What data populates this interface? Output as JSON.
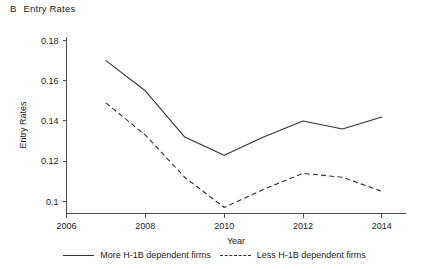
{
  "panel": {
    "letter": "B",
    "title": "Entry Rates"
  },
  "chart_data": {
    "type": "line",
    "title": "Entry Rates",
    "xlabel": "Year",
    "ylabel": "Entry Rates",
    "x": [
      2007,
      2008,
      2009,
      2010,
      2011,
      2012,
      2013,
      2014
    ],
    "xlim": [
      2006,
      2014.6
    ],
    "ylim": [
      0.094,
      0.182
    ],
    "xticks": [
      2006,
      2008,
      2010,
      2012,
      2014
    ],
    "xtick_labels": [
      "2006",
      "2008",
      "2010",
      "2012",
      "2014"
    ],
    "yticks": [
      0.1,
      0.12,
      0.14,
      0.16,
      0.18
    ],
    "ytick_labels": [
      "0.1",
      "0.12",
      "0.14",
      "0.16",
      "0.18"
    ],
    "grid": false,
    "legend_position": "bottom",
    "series": [
      {
        "name": "More H-1B dependent firms",
        "style": "solid",
        "color": "#333333",
        "values": [
          0.17,
          0.155,
          0.132,
          0.123,
          0.132,
          0.14,
          0.136,
          0.142
        ]
      },
      {
        "name": "Less H-1B dependent firms",
        "style": "dashed",
        "color": "#333333",
        "values": [
          0.149,
          0.133,
          0.112,
          0.097,
          0.106,
          0.114,
          0.112,
          0.105
        ]
      }
    ]
  },
  "legend": {
    "items": [
      {
        "label": "More H-1B dependent firms",
        "style": "solid"
      },
      {
        "label": "Less H-1B dependent firms",
        "style": "dashed"
      }
    ]
  }
}
